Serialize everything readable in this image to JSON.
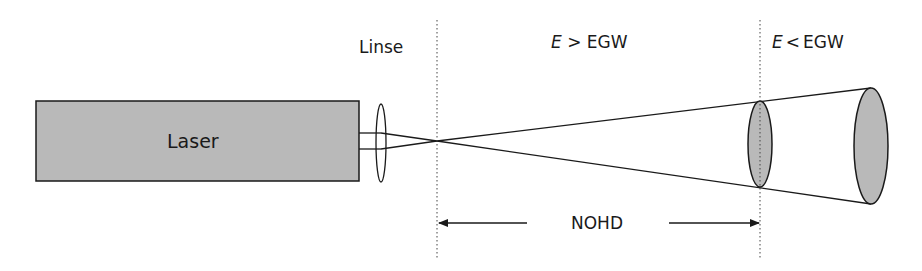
{
  "diagram": {
    "laser_label": "Laser",
    "lens_label": "Linse",
    "region_above": {
      "var": "E",
      "op": ">",
      "rest": "EGW"
    },
    "region_below": {
      "var": "E",
      "op": "<",
      "rest": "EGW"
    },
    "distance_label": "NOHD"
  },
  "colors": {
    "fill_gray": "#b9b9b9",
    "stroke": "#1a1a1a",
    "background": "#ffffff"
  }
}
